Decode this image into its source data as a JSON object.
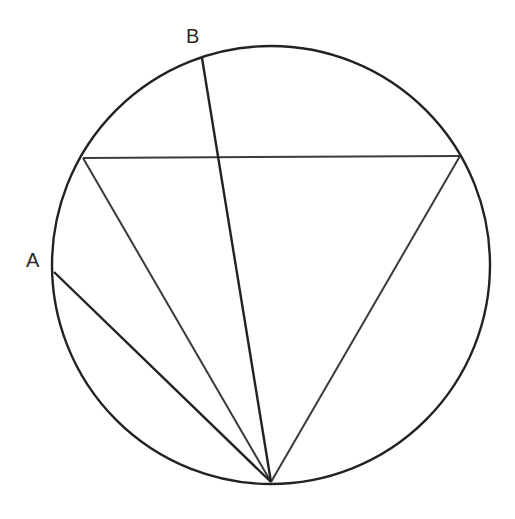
{
  "diagram": {
    "labels": {
      "point_a": "A",
      "point_b": "B"
    },
    "elements": [
      "circle",
      "inscribed-triangle",
      "chord-to-A",
      "chord-to-B"
    ],
    "colors": {
      "stroke": "#222222",
      "background": "#ffffff"
    }
  }
}
